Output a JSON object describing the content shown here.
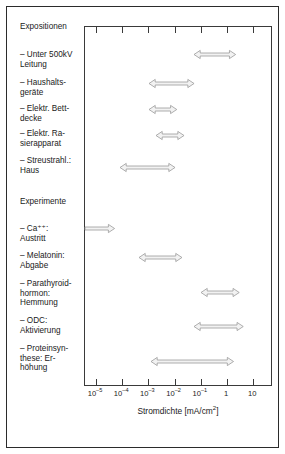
{
  "figure": {
    "groups": [
      {
        "name": "expositionen",
        "title": "Expositionen"
      },
      {
        "name": "experimente",
        "title": "Experimente"
      }
    ],
    "axis": {
      "label_text": "Stromdichte [mA/cm",
      "label_sup": "2",
      "label_tail": "]",
      "tick_labels": [
        {
          "mantissa": "10",
          "exponent": "–5",
          "decade": -5
        },
        {
          "mantissa": "10",
          "exponent": "–4",
          "decade": -4
        },
        {
          "mantissa": "10",
          "exponent": "–3",
          "decade": -3
        },
        {
          "mantissa": "10",
          "exponent": "–2",
          "decade": -2
        },
        {
          "mantissa": "10",
          "exponent": "–1",
          "decade": -1
        },
        {
          "mantissa": "1",
          "exponent": "",
          "decade": 0
        },
        {
          "mantissa": "10",
          "exponent": "",
          "decade": 1
        }
      ]
    },
    "rows": [
      {
        "name": "unter-500kv-leitung",
        "label": "– Unter 500kV\n   Leitung"
      },
      {
        "name": "haushaltsgeraete",
        "label": "– Haushalts-\n   geräte"
      },
      {
        "name": "elektr-bettdecke",
        "label": "– Elektr. Bett-\n   decke"
      },
      {
        "name": "elektr-rasierapparat",
        "label": "– Elektr. Ra-\n   sierapparat"
      },
      {
        "name": "streustrahl-haus",
        "label": "– Streustrahl.:\n   Haus"
      },
      {
        "name": "ca-austritt",
        "label": "– Ca⁺⁺:\n   Austritt"
      },
      {
        "name": "melatonin-abgabe",
        "label": "– Melatonin:\n   Abgabe"
      },
      {
        "name": "parathyroidhormon",
        "label": "– Parathyroid-\n   hormon:\n   Hemmung"
      },
      {
        "name": "odc-aktivierung",
        "label": "– ODC:\n   Aktivierung"
      },
      {
        "name": "proteinsynthese",
        "label": "– Proteinsyn-\n   these: Er-\n   höhung"
      }
    ]
  },
  "chart_data": {
    "type": "bar",
    "orientation": "horizontal",
    "title": "",
    "xlabel": "Stromdichte [mA/cm2]",
    "ylabel": "",
    "xscale": "log",
    "xlim": [
      -5.42,
      1.73
    ],
    "xticks": [
      -5,
      -4,
      -3,
      -2,
      -1,
      0,
      1
    ],
    "xticklabels": [
      "10-5",
      "10-4",
      "10-3",
      "10-2",
      "10-1",
      "1",
      "10"
    ],
    "grid": false,
    "legend": false,
    "accent_color": "#9a9a9a",
    "fill_color": "#f2f2f2",
    "categories": [
      "Unter 500kV Leitung",
      "Haushaltsgeräte",
      "Elektr. Bettdecke",
      "Elektr. Rasierapparat",
      "Streustrahl.: Haus",
      "Ca++: Austritt",
      "Melatonin: Abgabe",
      "Parathyroidhormon: Hemmung",
      "ODC: Aktivierung",
      "Proteinsynthese: Erhöhung"
    ],
    "ranges_log10": [
      {
        "category": "Unter 500kV Leitung",
        "group": "Expositionen",
        "start": -1.27,
        "end": 0.32,
        "arrow": "double"
      },
      {
        "category": "Haushaltsgeräte",
        "group": "Expositionen",
        "start": -2.98,
        "end": -1.26,
        "arrow": "double"
      },
      {
        "category": "Elektr. Bettdecke",
        "group": "Expositionen",
        "start": -2.98,
        "end": -1.92,
        "arrow": "double"
      },
      {
        "category": "Elektr. Rasierapparat",
        "group": "Expositionen",
        "start": -2.71,
        "end": -1.64,
        "arrow": "double"
      },
      {
        "category": "Streustrahl.: Haus",
        "group": "Expositionen",
        "start": -4.09,
        "end": -1.99,
        "arrow": "double"
      },
      {
        "category": "Ca++: Austritt",
        "group": "Experimente",
        "start": -5.42,
        "end": -4.29,
        "arrow": "right"
      },
      {
        "category": "Melatonin: Abgabe",
        "group": "Experimente",
        "start": -3.36,
        "end": -1.72,
        "arrow": "double"
      },
      {
        "category": "Parathyroidhormon: Hemmung",
        "group": "Experimente",
        "start": -0.99,
        "end": 0.47,
        "arrow": "double"
      },
      {
        "category": "ODC: Aktivierung",
        "group": "Experimente",
        "start": -1.26,
        "end": 0.62,
        "arrow": "double"
      },
      {
        "category": "Proteinsynthese: Erhöhung",
        "group": "Experimente",
        "start": -2.9,
        "end": 0.25,
        "arrow": "double"
      }
    ]
  }
}
